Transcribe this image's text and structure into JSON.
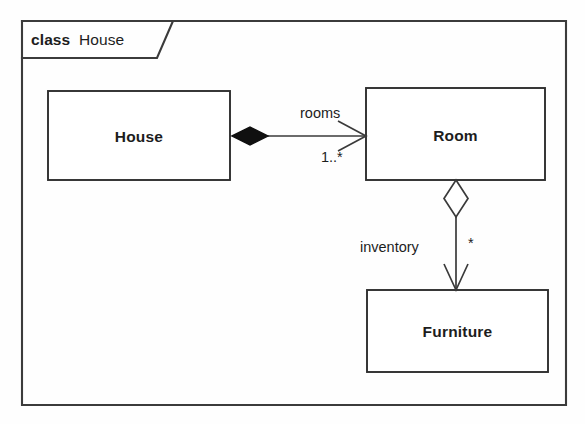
{
  "diagram": {
    "kind": "uml-class-diagram",
    "frame": {
      "keyword": "class",
      "name": "House"
    },
    "classes": [
      {
        "id": "house",
        "name": "House"
      },
      {
        "id": "room",
        "name": "Room"
      },
      {
        "id": "furniture",
        "name": "Furniture"
      }
    ],
    "relationships": [
      {
        "id": "house-room",
        "type": "composition",
        "source": "House",
        "target": "Room",
        "role_label": "rooms",
        "multiplicity": "1..*",
        "source_decoration": "filled-diamond",
        "target_decoration": "open-arrow",
        "direction": "horizontal"
      },
      {
        "id": "room-furniture",
        "type": "aggregation",
        "source": "Room",
        "target": "Furniture",
        "role_label": "inventory",
        "multiplicity": "*",
        "source_decoration": "hollow-diamond",
        "target_decoration": "open-arrow",
        "direction": "vertical"
      }
    ],
    "colors": {
      "line": "#3a3a3a",
      "frame": "#3b3b3b",
      "fill": "#ffffff",
      "text": "#1d1d1d",
      "background": "#fefefe"
    }
  }
}
